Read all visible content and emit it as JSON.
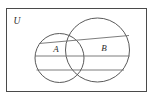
{
  "figure": {
    "background_color": "#ffffff",
    "stroke_color": "#5a5a5a",
    "frame_color": "#4a4a4a",
    "line_color": "#6e6e6e",
    "label_color": "#2b2b2b",
    "width": 153,
    "height": 105
  },
  "universe": {
    "label": "U",
    "label_x": 17,
    "label_y": 24,
    "frame": {
      "x": 6,
      "y": 8,
      "width": 141,
      "height": 84
    }
  },
  "sets": [
    {
      "name": "set-a",
      "label": "A",
      "label_x": 56,
      "label_y": 52,
      "cx": 59.5,
      "cy": 58,
      "r": 24.5
    },
    {
      "name": "set-b",
      "label": "B",
      "label_x": 104,
      "label_y": 51,
      "cx": 97.5,
      "cy": 50,
      "r": 32
    }
  ],
  "shading_lines": [
    {
      "name": "slanted-chord",
      "x1": 39,
      "y1": 43.5,
      "x2": 129,
      "y2": 35.5
    },
    {
      "name": "upper-horizontal-chord",
      "x1": 35,
      "y1": 56,
      "x2": 129.5,
      "y2": 56
    },
    {
      "name": "lower-horizontal-chord",
      "x1": 36.5,
      "y1": 70,
      "x2": 124,
      "y2": 70
    }
  ]
}
